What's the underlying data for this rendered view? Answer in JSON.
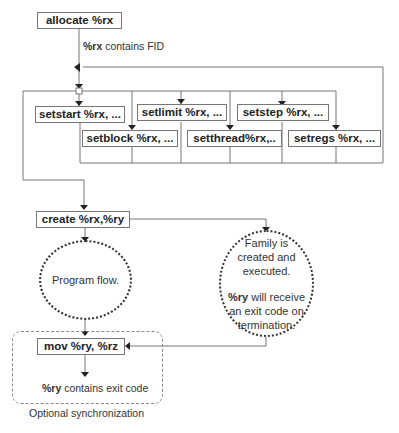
{
  "diagram": {
    "allocate": "allocate %rx",
    "fid_note": {
      "bold": "%rx",
      "rest": " contains FID"
    },
    "set_boxes": [
      "setstart %rx, ...",
      "setlimit %rx, ...",
      "setstep %rx, ...",
      "setblock %rx, ...",
      "setthread%rx,..",
      "setregs %rx, ..."
    ],
    "create": "create %rx,%ry",
    "program_flow": "Program flow.",
    "family": {
      "line1": "Family is",
      "line2": "created and",
      "line3": "executed.",
      "line4_bold": "%ry",
      "line4_rest": " will receive",
      "line5": "an exit code on",
      "line6": "termination."
    },
    "mov": "mov %ry, %rz",
    "exit_note": {
      "bold": "%ry",
      "rest": " contains exit code"
    },
    "group_label": "Optional synchronization"
  }
}
